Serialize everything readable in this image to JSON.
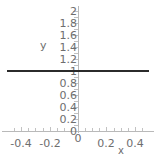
{
  "chart_data": {
    "type": "line",
    "title": "",
    "xlabel": "x",
    "ylabel": "y",
    "xlim": [
      -0.5,
      0.5
    ],
    "ylim": [
      0,
      2
    ],
    "grid": false,
    "legend": null,
    "x_ticks": [
      {
        "value": -0.4,
        "label": "-0.4"
      },
      {
        "value": -0.2,
        "label": "-0.2"
      },
      {
        "value": 0,
        "label": "0"
      },
      {
        "value": 0.2,
        "label": "0.2"
      },
      {
        "value": 0.4,
        "label": "0.4"
      }
    ],
    "y_ticks": [
      {
        "value": 2,
        "label": "2"
      },
      {
        "value": 1.8,
        "label": "1.8"
      },
      {
        "value": 1.6,
        "label": "1.6"
      },
      {
        "value": 1.4,
        "label": "1.4"
      },
      {
        "value": 1.2,
        "label": "1.2"
      },
      {
        "value": 1,
        "label": "1"
      },
      {
        "value": 0.8,
        "label": "0.8"
      },
      {
        "value": 0.6,
        "label": "0.6"
      },
      {
        "value": 0.4,
        "label": "0.4"
      },
      {
        "value": 0.2,
        "label": "0.2"
      },
      {
        "value": 0,
        "label": "0"
      }
    ],
    "y_minor_ticks": [
      1.9,
      1.7,
      1.5,
      1.3,
      1.1,
      0.9,
      0.7,
      0.5,
      0.3,
      0.1
    ],
    "x_minor_ticks": [
      -0.45,
      -0.35,
      -0.3,
      -0.25,
      -0.15,
      -0.1,
      -0.05,
      0.05,
      0.1,
      0.15,
      0.25,
      0.3,
      0.35,
      0.45
    ],
    "series": [
      {
        "name": "y = 1",
        "color": "#2b2b2b",
        "x": [
          -0.5,
          0.5
        ],
        "values": [
          1,
          1
        ]
      }
    ],
    "colors": {
      "series": "#2b2b2b",
      "axis": "#b9b9b9",
      "tick": "#c2c2c2",
      "text": "#6e6e6e",
      "background": "#ffffff"
    }
  }
}
